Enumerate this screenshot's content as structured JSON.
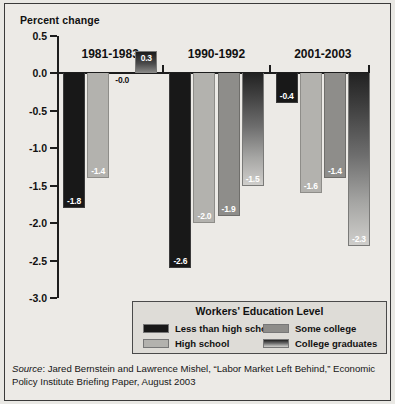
{
  "axis_title": "Percent change",
  "source": {
    "label": "Source",
    "text": ": Jared Bernstein and Lawrence Mishel, “Labor Market Left Behind,” Economic Policy Institute Briefing Paper, August 2003"
  },
  "legend": {
    "title": "Workers' Education Level",
    "items": [
      {
        "label": "Less than high school",
        "swatch": "black-swatch"
      },
      {
        "label": "High school",
        "swatch": "light-gray-swatch"
      },
      {
        "label": "Some college",
        "swatch": "medium-gray-swatch"
      },
      {
        "label": "College graduates",
        "swatch": "gradient-swatch"
      }
    ]
  },
  "chart_data": {
    "type": "bar",
    "title": "",
    "subtitle": "",
    "xlabel": "",
    "ylabel": "Percent change",
    "ylim": [
      -3.0,
      0.5
    ],
    "yticks": [
      0.5,
      0.0,
      -0.5,
      -1.0,
      -1.5,
      -2.0,
      -2.5,
      -3.0
    ],
    "ytick_labels": [
      "0.5",
      "0.0",
      "-0.5",
      "-1.0",
      "-1.5",
      "-2.0",
      "-2.5",
      "-3.0"
    ],
    "grid": false,
    "legend_position": "bottom",
    "categories": [
      "1981-1983",
      "1990-1992",
      "2001-2003"
    ],
    "series": [
      {
        "name": "Less than high school",
        "values": [
          -1.8,
          -2.6,
          -0.4
        ],
        "labels": [
          "-1.8",
          "-2.6",
          "-0.4"
        ]
      },
      {
        "name": "High school",
        "values": [
          -1.4,
          -2.0,
          -1.6
        ],
        "labels": [
          "-1.4",
          "-2.0",
          "-1.6"
        ]
      },
      {
        "name": "Some college",
        "values": [
          -0.0,
          -1.9,
          -1.4
        ],
        "labels": [
          "-0.0",
          "-1.9",
          "-1.4"
        ]
      },
      {
        "name": "College graduates",
        "values": [
          0.3,
          -1.5,
          -2.3
        ],
        "labels": [
          "0.3",
          "-1.5",
          "-2.3"
        ]
      }
    ]
  }
}
